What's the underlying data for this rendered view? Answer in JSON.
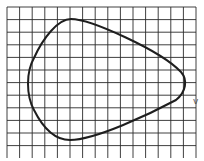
{
  "figure": {
    "background": "#ffffff",
    "grid": {
      "color": "#2a2a2a",
      "x_start": 7,
      "y_start": 7,
      "spacing": 12.6,
      "columns": 15,
      "rows": 12
    },
    "curve": {
      "color": "#1e1e1e",
      "stroke_width": 2,
      "path": "M 71 19 C 90 19, 160 50, 181 72 C 188 80, 186 92, 176 100 C 150 114, 95 140, 70 140 C 55 140, 43 128, 34 110 C 26 95, 26 72, 34 58 C 43 38, 58 19, 71 19 Z"
    },
    "marker": {
      "label": "ⅴ",
      "x": 193,
      "y": 104,
      "color": "#555555"
    }
  }
}
